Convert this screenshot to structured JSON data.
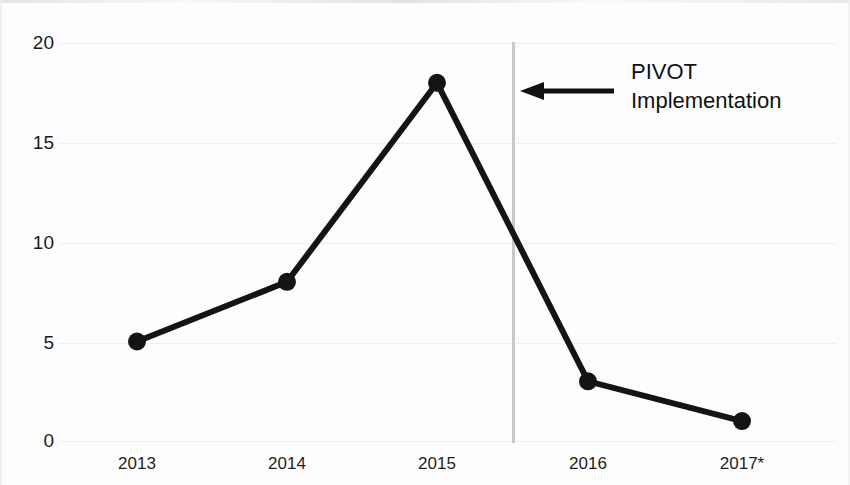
{
  "chart_data": {
    "type": "line",
    "title": "",
    "subtitle": "",
    "xlabel": "",
    "ylabel": "",
    "categories": [
      "2013",
      "2014",
      "2015",
      "2016",
      "2017*"
    ],
    "values": [
      5,
      8,
      18,
      3,
      1
    ],
    "series": [
      {
        "name": "",
        "values": [
          5,
          8,
          18,
          3,
          1
        ]
      }
    ],
    "ylim": [
      0,
      20
    ],
    "yticks": [
      0,
      5,
      10,
      15,
      20
    ],
    "ytick_labels": [
      "0",
      "5",
      "10",
      "15",
      "20"
    ],
    "xtick_labels": [
      "2013",
      "2014",
      "2015",
      "2016",
      "2017*"
    ],
    "grid": true,
    "grid_axis": "y",
    "legend": false,
    "legend_position": "none",
    "markers": "filled-circle",
    "line_color": "#141414",
    "marker_color": "#141414",
    "grid_color": "#f0f0f1",
    "background_color": "#fdfdfd",
    "annotations": [
      {
        "type": "vertical-line",
        "label": "PIVOT Implementation",
        "x_between": [
          "2015",
          "2016"
        ],
        "x_fraction": 0.5,
        "color": "#c9c9c9"
      },
      {
        "type": "arrow-label",
        "text_line_1": "PIVOT",
        "text_line_2": "Implementation",
        "arrow_direction": "left",
        "color": "#111111"
      }
    ]
  },
  "axis": {
    "y_labels": [
      "20",
      "15",
      "10",
      "5",
      "0"
    ],
    "x_labels": [
      "2013",
      "2014",
      "2015",
      "2016",
      "2017*"
    ]
  },
  "annotation": {
    "line_1": "PIVOT",
    "line_2": "Implementation"
  }
}
